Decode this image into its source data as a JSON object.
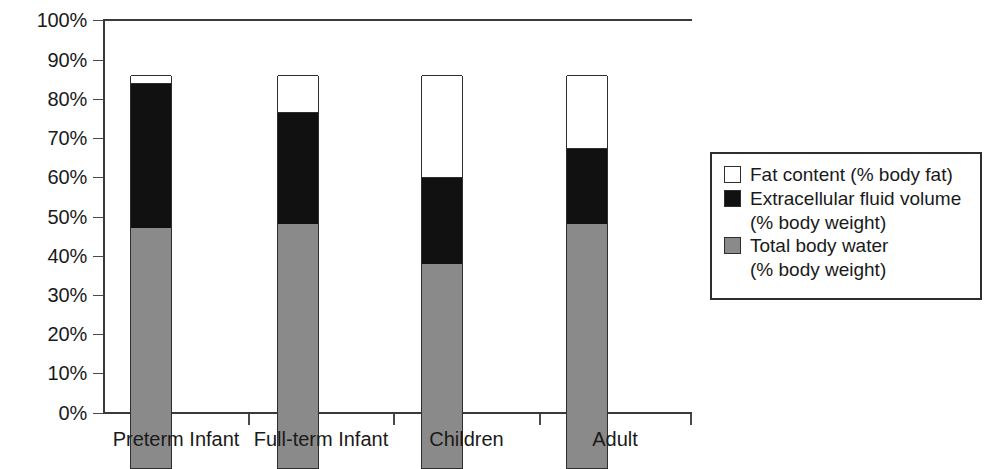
{
  "chart_data": {
    "type": "bar",
    "subtype": "stacked-bar-100",
    "title": "",
    "xlabel": "",
    "ylabel": "",
    "ylim": [
      0,
      100
    ],
    "grid": false,
    "legend_position": "right",
    "categories": [
      "Preterm Infant",
      "Full-term Infant",
      "Children",
      "Adult"
    ],
    "y_ticks": [
      "0%",
      "10%",
      "20%",
      "30%",
      "40%",
      "50%",
      "60%",
      "70%",
      "80%",
      "90%",
      "100%"
    ],
    "y_tick_values": [
      0,
      10,
      20,
      30,
      40,
      50,
      60,
      70,
      80,
      90,
      100
    ],
    "series": [
      {
        "name": "Total body water (% body weight)",
        "color": "#8a8a8a",
        "values": [
          61,
          62,
          52,
          62
        ]
      },
      {
        "name": "Extracellular fluid volume (% body weight)",
        "color": "#111111",
        "values": [
          37,
          28.5,
          22,
          19.5
        ]
      },
      {
        "name": "Fat content (% body fat)",
        "color": "#ffffff",
        "values": [
          2,
          9.5,
          26,
          18.5
        ]
      }
    ],
    "cumulative_tops": [
      {
        "category": "Preterm Infant",
        "tbw_top": 61,
        "ecf_top": 98,
        "fat_top": 100
      },
      {
        "category": "Full-term Infant",
        "tbw_top": 62,
        "ecf_top": 90.5,
        "fat_top": 100
      },
      {
        "category": "Children",
        "tbw_top": 52,
        "ecf_top": 74,
        "fat_top": 100
      },
      {
        "category": "Adult",
        "tbw_top": 62,
        "ecf_top": 81.5,
        "fat_top": 100
      }
    ]
  },
  "legend": {
    "entries": [
      {
        "label": "Fat content (% body fat)",
        "label2": "",
        "swatch": "white"
      },
      {
        "label": "Extracellular fluid volume",
        "label2": "(% body weight)",
        "swatch": "black"
      },
      {
        "label": "Total body water",
        "label2": "(% body weight)",
        "swatch": "gray"
      }
    ]
  },
  "colors": {
    "total_body_water": "#8a8a8a",
    "extracellular_fluid": "#111111",
    "fat_content": "#ffffff",
    "axis": "#3a3a3a",
    "outline": "#2e2e2e"
  }
}
